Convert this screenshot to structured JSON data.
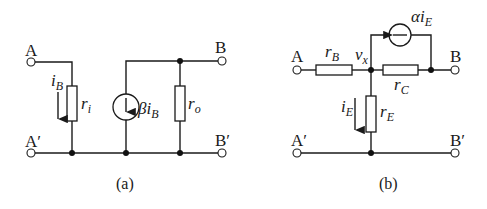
{
  "diagrams": [
    {
      "caption": "(a)",
      "terminals": {
        "A": "A",
        "A_prime": "A′",
        "B": "B",
        "B_prime": "B′"
      },
      "components": {
        "r_i": {
          "main": "r",
          "sub": "i"
        },
        "r_o": {
          "main": "r",
          "sub": "o"
        },
        "current_source": {
          "main": "βi",
          "sub": "B"
        },
        "current_label": {
          "main": "i",
          "sub": "B"
        }
      }
    },
    {
      "caption": "(b)",
      "terminals": {
        "A": "A",
        "A_prime": "A′",
        "B": "B",
        "B_prime": "B′"
      },
      "components": {
        "r_B": {
          "main": "r",
          "sub": "B"
        },
        "r_C": {
          "main": "r",
          "sub": "C"
        },
        "r_E": {
          "main": "r",
          "sub": "E"
        },
        "node_vx": {
          "main": "v",
          "sub": "x"
        },
        "current_source": {
          "main": "αi",
          "sub": "E"
        },
        "current_label": {
          "main": "i",
          "sub": "E"
        }
      }
    }
  ]
}
